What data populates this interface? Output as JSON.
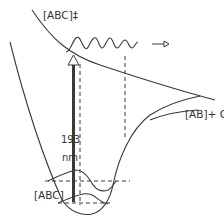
{
  "diagram": {
    "type": "potential-energy-diagram",
    "labels": {
      "transition_state": "[ABC]‡",
      "products": "[AB]+ C",
      "ground_state": "[ABC]",
      "wavelength_value": "193",
      "wavelength_unit": "nm"
    },
    "colors": {
      "line": "#3a3a3a",
      "text": "#333333",
      "background": "#ffffff"
    },
    "elements": [
      "upper repulsive potential curve",
      "ground-state potential well",
      "dissociation asymptote to [AB]+C",
      "vertical excitation arrow (193 nm)",
      "vertical dashed projection lines",
      "outgoing wavepacket with arrow",
      "vibrational wavefunctions in ground well"
    ]
  }
}
